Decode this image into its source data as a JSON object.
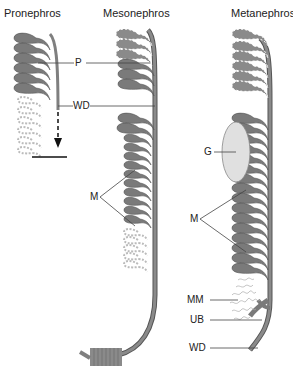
{
  "figure": {
    "titles": {
      "pronephros": "Pronephros",
      "mesonephros": "Mesonephros",
      "metanephros": "Metanephros"
    },
    "labels": {
      "p": "P",
      "wd_top": "WD",
      "m_meso": "M",
      "g": "G",
      "m_meta": "M",
      "mm": "MM",
      "ub": "UB",
      "wd_bottom": "WD"
    },
    "colors": {
      "tubule": "#7a7a7a",
      "tubule_outline": "#555555",
      "duct": "#7f7f7f",
      "faded": "#bdbdbd",
      "glomerulus": "#dcdcdc",
      "line": "#444444"
    }
  }
}
